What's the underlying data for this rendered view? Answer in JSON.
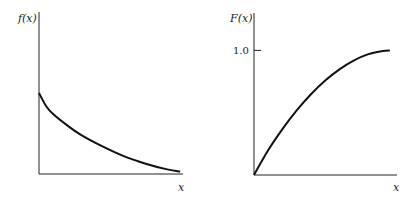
{
  "chart_data": [
    {
      "type": "line",
      "title": "",
      "ylabel": "f(x)",
      "xlabel": "x",
      "description": "Decreasing density curve",
      "x": [
        0,
        0.05,
        0.1,
        0.2,
        0.3,
        0.45,
        0.6,
        0.75,
        0.9,
        1.0
      ],
      "values": [
        0.5,
        0.42,
        0.37,
        0.3,
        0.24,
        0.17,
        0.11,
        0.065,
        0.03,
        0.015
      ],
      "xlim": [
        0,
        1.02
      ],
      "ylim": [
        0,
        1.0
      ],
      "yticks": [],
      "xticks": [],
      "grid": false
    },
    {
      "type": "line",
      "title": "",
      "ylabel": "F(x)",
      "xlabel": "x",
      "description": "Increasing cumulative curve approaching 1.0",
      "x": [
        0,
        0.1,
        0.2,
        0.3,
        0.4,
        0.5,
        0.6,
        0.7,
        0.8,
        0.9,
        0.95
      ],
      "values": [
        0,
        0.2,
        0.37,
        0.52,
        0.65,
        0.76,
        0.85,
        0.92,
        0.97,
        0.995,
        1.0
      ],
      "xlim": [
        0,
        1.0
      ],
      "ylim": [
        0,
        1.3
      ],
      "yticks": [
        1.0
      ],
      "ytick_labels": [
        "1.0"
      ],
      "xticks": [],
      "grid": false
    }
  ]
}
